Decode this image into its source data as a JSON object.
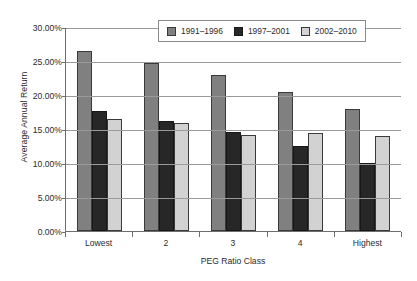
{
  "chart_data": {
    "type": "bar",
    "title": "",
    "xlabel": "PEG Ratio Class",
    "ylabel": "Average Annual Return",
    "categories": [
      "Lowest",
      "2",
      "3",
      "4",
      "Highest"
    ],
    "series": [
      {
        "name": "1991–1996",
        "color": "#808080",
        "values": [
          26.5,
          24.7,
          23.0,
          20.5,
          18.0
        ]
      },
      {
        "name": "1997–2001",
        "color": "#272727",
        "values": [
          17.7,
          16.2,
          14.6,
          12.5,
          10.0
        ]
      },
      {
        "name": "2002–2010",
        "color": "#d2d2d2",
        "values": [
          16.5,
          15.9,
          14.1,
          14.4,
          14.0
        ]
      }
    ],
    "ylim": [
      0,
      30
    ],
    "ytick_step": 5,
    "ytick_labels": [
      "0.00%",
      "5.00%",
      "10.00%",
      "15.00%",
      "20.00%",
      "25.00%",
      "30.00%"
    ],
    "ytick_values": [
      0,
      5,
      10,
      15,
      20,
      25,
      30
    ],
    "grid": true,
    "legend_position": "top-center",
    "value_suffix": "%"
  },
  "axes": {
    "y_title": "Average Annual Return",
    "x_title": "PEG Ratio Class"
  },
  "legend": {
    "entries": [
      {
        "label": "1991–1996",
        "swatch": "series-1-swatch"
      },
      {
        "label": "1997–2001",
        "swatch": "series-2-swatch"
      },
      {
        "label": "2002–2010",
        "swatch": "series-3-swatch"
      }
    ]
  },
  "colors": {
    "series_1": "#808080",
    "series_2": "#272727",
    "series_3": "#d2d2d2",
    "grid": "#9a9a9a",
    "axis": "#6e6e6e",
    "text": "#2b2b2b",
    "background": "#ffffff"
  }
}
